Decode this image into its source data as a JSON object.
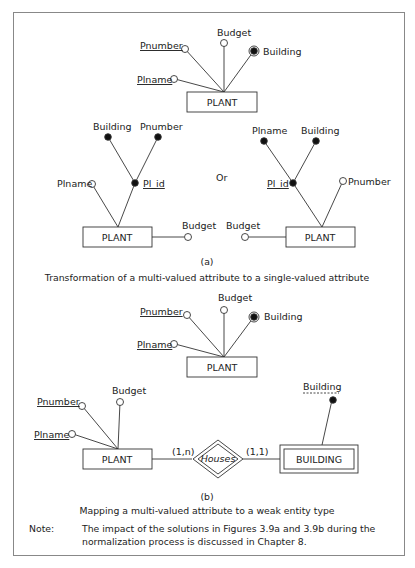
{
  "figure_a_top": {
    "entity": "PLANT",
    "attributes": [
      {
        "name": "Pnumber",
        "underline": true,
        "type": "single"
      },
      {
        "name": "Budget",
        "underline": false,
        "type": "single"
      },
      {
        "name": "Building",
        "underline": false,
        "type": "multi-valued"
      },
      {
        "name": "Plname",
        "underline": true,
        "type": "single"
      }
    ]
  },
  "figure_a_left": {
    "entity": "PLANT",
    "composite": "Pl_id",
    "composite_parts": [
      "Building",
      "Pnumber"
    ],
    "other": [
      "Plname",
      "Budget"
    ]
  },
  "figure_a_or": "Or",
  "figure_a_right": {
    "entity": "PLANT",
    "composite": "Pl_id",
    "composite_parts": [
      "Plname",
      "Building"
    ],
    "other": [
      "Pnumber",
      "Budget"
    ]
  },
  "caption_a": {
    "label": "(a)",
    "text": "Transformation of a multi-valued attribute to a single-valued attribute"
  },
  "figure_b_top": {
    "entity": "PLANT",
    "attributes": [
      "Pnumber",
      "Budget",
      "Building",
      "Plname"
    ]
  },
  "figure_b_bottom": {
    "entity_left": "PLANT",
    "left_attributes": [
      "Pnumber",
      "Budget",
      "Plname"
    ],
    "relationship": "Houses",
    "card_left": "(1,n)",
    "card_right": "(1,1)",
    "weak_entity": "BUILDING",
    "weak_attribute": "Building"
  },
  "caption_b": {
    "label": "(b)",
    "text": "Mapping a multi-valued attribute to a weak entity type"
  },
  "note": {
    "label": "Note:",
    "text": "The impact of the solutions in Figures 3.9a and 3.9b during the normalization process is discussed in Chapter 8."
  }
}
